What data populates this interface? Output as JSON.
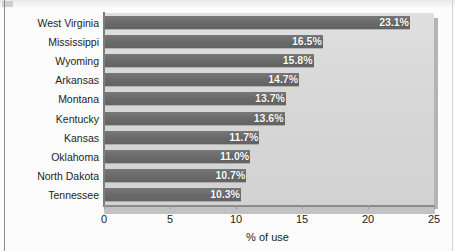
{
  "chart_data": {
    "type": "bar",
    "orientation": "horizontal",
    "title": "",
    "xlabel": "% of use",
    "ylabel": "",
    "xlim": [
      0,
      25
    ],
    "xticks": [
      0,
      5,
      10,
      15,
      20,
      25
    ],
    "xtick_labels": [
      "0",
      "5",
      "10",
      "15",
      "20",
      "25"
    ],
    "grid": false,
    "legend": null,
    "categories": [
      "West Virginia",
      "Mississippi",
      "Wyoming",
      "Arkansas",
      "Montana",
      "Kentucky",
      "Kansas",
      "Oklahoma",
      "North Dakota",
      "Tennessee"
    ],
    "values": [
      23.1,
      16.5,
      15.8,
      14.7,
      13.7,
      13.6,
      11.7,
      11.0,
      10.7,
      10.3
    ],
    "value_labels": [
      "23.1%",
      "16.5%",
      "15.8%",
      "14.7%",
      "13.7%",
      "13.6%",
      "11.7%",
      "11.0%",
      "10.7%",
      "10.3%"
    ],
    "colors": {
      "bar": "#6a6a6a",
      "plot_background": "#d7d7d7",
      "value_text": "#ffffff",
      "axis": "#8a8a8a",
      "label_text": "#1c1c1c"
    }
  }
}
